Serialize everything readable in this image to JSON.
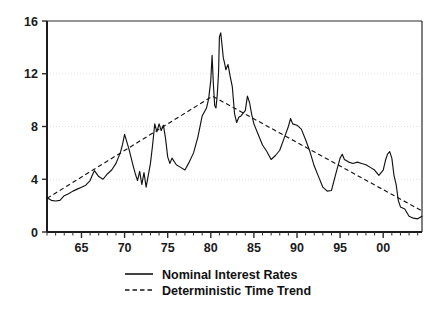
{
  "chart_data": {
    "type": "line",
    "title": "",
    "subtitle": "",
    "xlabel": "",
    "ylabel": "",
    "xlim": [
      1961.0,
      2004.5
    ],
    "ylim": [
      0,
      16
    ],
    "grid": true,
    "grid_axis": "y",
    "legend_position": "bottom-center",
    "y_ticks": [
      0,
      4,
      8,
      12,
      16
    ],
    "y_tick_labels": [
      "0",
      "4",
      "8",
      "12",
      "16"
    ],
    "x_ticks": [
      1965,
      1970,
      1975,
      1980,
      1985,
      1990,
      1995,
      2000
    ],
    "x_tick_labels": [
      "65",
      "70",
      "75",
      "80",
      "85",
      "90",
      "95",
      "00"
    ],
    "x_minor_tick_interval": 1,
    "series": [
      {
        "name": "Nominal Interest Rates",
        "style": "solid",
        "color": "#121212",
        "x": [
          1961.0,
          1961.5,
          1962.0,
          1962.5,
          1963.0,
          1963.5,
          1964.0,
          1964.5,
          1965.0,
          1965.5,
          1966.0,
          1966.25,
          1966.5,
          1967.0,
          1967.5,
          1968.0,
          1968.5,
          1969.0,
          1969.25,
          1969.5,
          1969.75,
          1970.0,
          1970.5,
          1971.0,
          1971.25,
          1971.5,
          1971.75,
          1972.0,
          1972.25,
          1972.5,
          1973.0,
          1973.25,
          1973.5,
          1973.75,
          1974.0,
          1974.25,
          1974.5,
          1974.75,
          1975.0,
          1975.25,
          1975.5,
          1976.0,
          1976.5,
          1977.0,
          1977.5,
          1978.0,
          1978.5,
          1979.0,
          1979.5,
          1979.75,
          1980.0,
          1980.15,
          1980.3,
          1980.45,
          1980.6,
          1980.75,
          1980.9,
          1981.0,
          1981.15,
          1981.3,
          1981.45,
          1981.6,
          1981.75,
          1982.0,
          1982.25,
          1982.5,
          1982.75,
          1983.0,
          1983.25,
          1983.5,
          1984.0,
          1984.25,
          1984.5,
          1984.75,
          1985.0,
          1985.5,
          1986.0,
          1986.5,
          1987.0,
          1987.5,
          1988.0,
          1988.5,
          1989.0,
          1989.25,
          1989.5,
          1990.0,
          1990.5,
          1991.0,
          1991.5,
          1992.0,
          1992.5,
          1993.0,
          1993.5,
          1994.0,
          1994.5,
          1995.0,
          1995.25,
          1995.5,
          1996.0,
          1996.5,
          1997.0,
          1997.5,
          1998.0,
          1998.5,
          1999.0,
          1999.5,
          2000.0,
          2000.25,
          2000.5,
          2000.75,
          2001.0,
          2001.25,
          2001.5,
          2001.75,
          2002.0,
          2002.5,
          2003.0,
          2003.5,
          2004.0,
          2004.5
        ],
        "y": [
          2.6,
          2.4,
          2.35,
          2.4,
          2.75,
          2.9,
          3.1,
          3.25,
          3.4,
          3.55,
          3.9,
          4.3,
          4.65,
          4.2,
          4.0,
          4.4,
          4.7,
          5.2,
          5.6,
          6.0,
          6.6,
          7.4,
          6.3,
          5.0,
          4.4,
          3.9,
          4.6,
          3.6,
          4.5,
          3.4,
          5.2,
          6.6,
          8.2,
          7.6,
          8.2,
          7.7,
          8.1,
          7.1,
          5.7,
          5.2,
          5.6,
          5.1,
          4.9,
          4.7,
          5.3,
          6.0,
          7.2,
          8.8,
          9.4,
          10.1,
          11.5,
          13.4,
          11.2,
          9.6,
          9.4,
          10.4,
          12.1,
          14.8,
          15.1,
          14.2,
          13.2,
          12.8,
          12.3,
          12.7,
          11.8,
          11.0,
          9.0,
          8.3,
          8.7,
          8.8,
          9.2,
          10.3,
          9.8,
          8.9,
          8.2,
          7.4,
          6.6,
          6.1,
          5.5,
          5.8,
          6.2,
          7.1,
          8.0,
          8.6,
          8.2,
          8.1,
          7.8,
          7.0,
          6.1,
          5.0,
          4.2,
          3.4,
          3.1,
          3.15,
          4.4,
          5.6,
          5.9,
          5.5,
          5.3,
          5.2,
          5.3,
          5.2,
          5.1,
          4.9,
          4.7,
          4.3,
          4.7,
          5.4,
          5.9,
          6.1,
          5.6,
          4.3,
          3.6,
          2.4,
          1.9,
          1.75,
          1.2,
          1.05,
          1.0,
          1.2
        ]
      },
      {
        "name": "Deterministic Time Trend",
        "style": "dashed",
        "color": "#141414",
        "x": [
          1961.0,
          1980.2,
          2004.5
        ],
        "y": [
          2.55,
          10.3,
          1.6
        ]
      }
    ]
  },
  "legend": {
    "entries": [
      {
        "label": "Nominal Interest Rates",
        "style": "solid"
      },
      {
        "label": "Deterministic Time Trend",
        "style": "dashed"
      }
    ]
  },
  "colors": {
    "background": "#ffffff",
    "axis": "#1c1c1c",
    "grid": "#e2e2e2",
    "series_solid": "#121212",
    "series_dashed": "#141414",
    "text": "#111111"
  }
}
